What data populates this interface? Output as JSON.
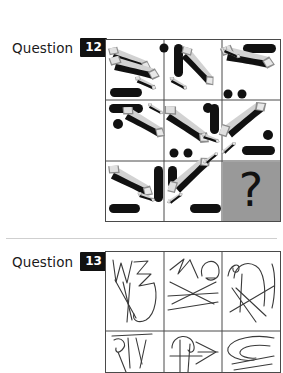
{
  "page": {
    "background_color": "#ffffff",
    "divider_color": "#cfcfcf"
  },
  "questions": [
    {
      "id": "q12",
      "label": "Question",
      "number": "12",
      "badge_bg": "#111111",
      "badge_fg": "#ffffff",
      "type": "raven-progressive-matrix",
      "matrix": {
        "rows": 3,
        "cols": 3,
        "border_color": "#4a4a4a",
        "missing_cell": {
          "row": 3,
          "col": 3,
          "marker": "?",
          "background": "#999999",
          "marker_color": "#111111"
        },
        "cells": [
          {
            "row": 1,
            "col": 1,
            "shapes": "two-thick-diagonal-bars-with-grey-shadow, one-horizontal-black-capsule"
          },
          {
            "row": 1,
            "col": 2,
            "shapes": "one-vertical-black-capsule, one-black-dot, one-diagonal-bar-with-grey-shadow"
          },
          {
            "row": 1,
            "col": 3,
            "shapes": "one-horizontal-black-capsule, one-long-diagonal-bar-with-grey-shadow"
          },
          {
            "row": 2,
            "col": 1,
            "shapes": "two-horizontal-black-capsules, one-black-dot, one-diagonal-bar-with-grey-shadow"
          },
          {
            "row": 2,
            "col": 2,
            "shapes": "one-diagonal-bar-with-grey-shadow, two-black-dots, one-vertical-black-capsule"
          },
          {
            "row": 2,
            "col": 3,
            "shapes": "one-long-diagonal-bar-with-grey-shadow, one-black-dot, one-horizontal-black-capsule"
          },
          {
            "row": 3,
            "col": 1,
            "shapes": "one-diagonal-bar-with-grey-shadow, one-vertical-black-capsule, one-horizontal-black-capsule"
          },
          {
            "row": 3,
            "col": 2,
            "shapes": "one-diagonal-bar-with-grey-shadow, one-short-vertical-black-capsule, one-horizontal-black-capsule"
          },
          {
            "row": 3,
            "col": 3,
            "shapes": "question-mark"
          }
        ]
      }
    },
    {
      "id": "q13",
      "label": "Question",
      "number": "13",
      "badge_bg": "#111111",
      "badge_fg": "#ffffff",
      "type": "raven-progressive-matrix",
      "matrix": {
        "rows": 3,
        "cols": 3,
        "visible_rows": 2,
        "clipped": true,
        "border_color": "#4a4a4a",
        "cells": [
          {
            "row": 1,
            "col": 1,
            "shapes": "hand-drawn-zigzag-and-loop-scribble"
          },
          {
            "row": 1,
            "col": 2,
            "shapes": "hand-drawn-zigzag-arc-and-crossing-lines"
          },
          {
            "row": 1,
            "col": 3,
            "shapes": "hand-drawn-arch-and-crossing-lines"
          },
          {
            "row": 2,
            "col": 1,
            "shapes": "hand-drawn-curve-and-v-strokes"
          },
          {
            "row": 2,
            "col": 2,
            "shapes": "hand-drawn-loop-with-arrow-strokes"
          },
          {
            "row": 2,
            "col": 3,
            "shapes": "hand-drawn-nested-curves"
          }
        ]
      }
    }
  ]
}
